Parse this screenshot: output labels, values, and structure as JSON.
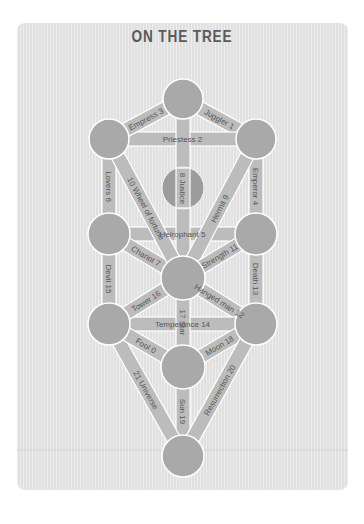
{
  "title": "ON THE TREE",
  "colors": {
    "background": "#ffffff",
    "card": "#e4e4e4",
    "node": "#a9a9a9",
    "path": "#bcbcbc",
    "text": "#555555",
    "outline": "#ffffff"
  },
  "nodes": [
    {
      "id": "top",
      "cx": 183,
      "cy": 99,
      "r": 20
    },
    {
      "id": "left-upper",
      "cx": 109,
      "cy": 139,
      "r": 20
    },
    {
      "id": "right-upper",
      "cx": 256,
      "cy": 139,
      "r": 20
    },
    {
      "id": "hidden",
      "cx": 183,
      "cy": 188,
      "r": 21
    },
    {
      "id": "left-middle",
      "cx": 109,
      "cy": 234,
      "r": 21
    },
    {
      "id": "right-middle",
      "cx": 256,
      "cy": 234,
      "r": 21
    },
    {
      "id": "center",
      "cx": 183,
      "cy": 278,
      "r": 22
    },
    {
      "id": "left-lower",
      "cx": 109,
      "cy": 324,
      "r": 21
    },
    {
      "id": "right-lower",
      "cx": 256,
      "cy": 324,
      "r": 21
    },
    {
      "id": "lower-center",
      "cx": 183,
      "cy": 367,
      "r": 22
    },
    {
      "id": "bottom",
      "cx": 183,
      "cy": 456,
      "r": 21
    }
  ],
  "paths": [
    {
      "label": "Juggler 1",
      "from": "top",
      "to": "right-upper"
    },
    {
      "label": "Priestess 2",
      "from": "left-upper",
      "to": "right-upper"
    },
    {
      "label": "Empress 3",
      "from": "top",
      "to": "left-upper"
    },
    {
      "label": "Emperor 4",
      "from": "right-upper",
      "to": "right-middle"
    },
    {
      "label": "Heirophant 5",
      "from": "left-middle",
      "to": "right-middle"
    },
    {
      "label": "Lovers 6",
      "from": "left-upper",
      "to": "left-middle"
    },
    {
      "label": "Chariot 7",
      "from": "left-middle",
      "to": "center"
    },
    {
      "label": "8 Justice",
      "from": "top",
      "to": "center"
    },
    {
      "label": "Hermit 9",
      "from": "right-upper",
      "to": "center"
    },
    {
      "label": "10 Wheel of fortune",
      "from": "left-upper",
      "to": "center"
    },
    {
      "label": "Strength 11",
      "from": "right-middle",
      "to": "center"
    },
    {
      "label": "Hanged man 12",
      "from": "center",
      "to": "right-lower"
    },
    {
      "label": "Death 13",
      "from": "right-middle",
      "to": "right-lower"
    },
    {
      "label": "Temperance 14",
      "from": "left-lower",
      "to": "right-lower"
    },
    {
      "label": "Devil 15",
      "from": "left-middle",
      "to": "left-lower"
    },
    {
      "label": "Tower 16",
      "from": "center",
      "to": "left-lower"
    },
    {
      "label": "17 Star",
      "from": "center",
      "to": "lower-center"
    },
    {
      "label": "Moon 18",
      "from": "lower-center",
      "to": "right-lower"
    },
    {
      "label": "Sun 19",
      "from": "lower-center",
      "to": "bottom"
    },
    {
      "label": "Resurrection 20",
      "from": "right-lower",
      "to": "bottom"
    },
    {
      "label": "21 Universe",
      "from": "left-lower",
      "to": "bottom"
    },
    {
      "label": "Fool 0",
      "from": "left-lower",
      "to": "lower-center"
    }
  ]
}
